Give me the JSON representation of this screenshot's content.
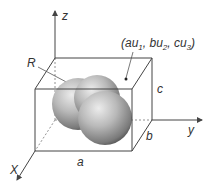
{
  "diagram": {
    "axes": {
      "z": "z",
      "y": "y",
      "x": "X"
    },
    "dimensions": {
      "a": "a",
      "b": "b",
      "c": "c"
    },
    "radius_label": "R",
    "point_label": {
      "open": "(au",
      "s1": "1",
      "mid1": ", bu",
      "s2": "2",
      "mid2": ", cu",
      "s3": "3",
      "close": ")"
    },
    "colors": {
      "line": "#444444",
      "sphere_light": "#e6e6e6",
      "sphere_mid": "#a8a8a8",
      "sphere_dark": "#555555"
    }
  }
}
